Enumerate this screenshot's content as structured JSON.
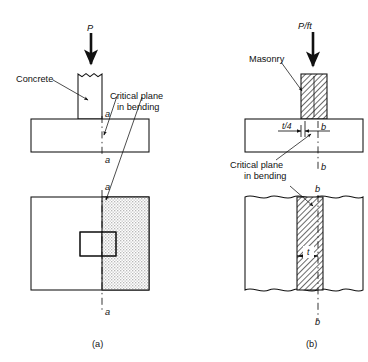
{
  "figure": {
    "panels": [
      {
        "id": "a",
        "caption": "(a)",
        "load_label": "P",
        "material_label": "Concrete",
        "critical_plane_label_line1": "Critical plane",
        "critical_plane_label_line2": "in bending",
        "section_marks": [
          "a",
          "a",
          "a",
          "a"
        ],
        "views": [
          "elevation",
          "plan"
        ]
      },
      {
        "id": "b",
        "caption": "(b)",
        "load_label": "P/ft",
        "material_label": "Masonry",
        "critical_plane_label_line1": "Critical plane",
        "critical_plane_label_line2": "in bending",
        "dimension_labels": [
          "t/4",
          "b",
          "t"
        ],
        "section_marks": [
          "b",
          "b",
          "b",
          "b"
        ],
        "views": [
          "elevation",
          "plan"
        ]
      }
    ],
    "icons": {
      "load_arrow": "down-arrow-icon",
      "leader_arrow": "leader-arrow-icon"
    },
    "colors": {
      "ink": "#111111",
      "paper": "#ffffff",
      "stipple": "#d8d8d8",
      "hatch": "#111111"
    }
  }
}
